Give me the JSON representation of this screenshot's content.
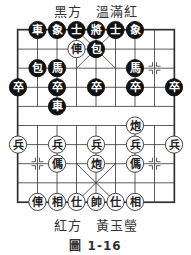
{
  "header": {
    "black_side": "黑方　溫滿紅"
  },
  "footer": {
    "red_side": "紅方　黃玉瑩",
    "figure": "圖 1-16"
  },
  "board": {
    "cols": 9,
    "rows": 10,
    "origin_x": 18,
    "origin_y": 30,
    "dx": 19.5,
    "dy": 19.1,
    "colors": {
      "line": "#333333",
      "black_piece": "#111111",
      "red_piece_fill": "#ffffff",
      "red_piece_text": "#222222"
    },
    "pieces": [
      {
        "side": "black",
        "char": "車",
        "col": 1,
        "row": 0
      },
      {
        "side": "black",
        "char": "象",
        "col": 2,
        "row": 0
      },
      {
        "side": "black",
        "char": "士",
        "col": 3,
        "row": 0
      },
      {
        "side": "black",
        "char": "將",
        "col": 4,
        "row": 0
      },
      {
        "side": "black",
        "char": "士",
        "col": 5,
        "row": 0
      },
      {
        "side": "black",
        "char": "象",
        "col": 6,
        "row": 0
      },
      {
        "side": "red",
        "char": "俥",
        "col": 3,
        "row": 1
      },
      {
        "side": "black",
        "char": "包",
        "col": 4,
        "row": 1
      },
      {
        "side": "black",
        "char": "包",
        "col": 1,
        "row": 2
      },
      {
        "side": "black",
        "char": "馬",
        "col": 2,
        "row": 2
      },
      {
        "side": "black",
        "char": "馬",
        "col": 6,
        "row": 2
      },
      {
        "side": "black",
        "char": "卒",
        "col": 0,
        "row": 3
      },
      {
        "side": "black",
        "char": "卒",
        "col": 2,
        "row": 3
      },
      {
        "side": "black",
        "char": "卒",
        "col": 4,
        "row": 3
      },
      {
        "side": "black",
        "char": "卒",
        "col": 6,
        "row": 3
      },
      {
        "side": "black",
        "char": "卒",
        "col": 8,
        "row": 3
      },
      {
        "side": "black",
        "char": "車",
        "col": 2,
        "row": 4
      },
      {
        "side": "red",
        "char": "炮",
        "col": 6,
        "row": 5
      },
      {
        "side": "red",
        "char": "兵",
        "col": 0,
        "row": 6
      },
      {
        "side": "red",
        "char": "兵",
        "col": 2,
        "row": 6
      },
      {
        "side": "red",
        "char": "兵",
        "col": 4,
        "row": 6
      },
      {
        "side": "red",
        "char": "兵",
        "col": 6,
        "row": 6
      },
      {
        "side": "red",
        "char": "兵",
        "col": 8,
        "row": 6
      },
      {
        "side": "red",
        "char": "傌",
        "col": 2,
        "row": 7
      },
      {
        "side": "red",
        "char": "炮",
        "col": 4,
        "row": 7
      },
      {
        "side": "red",
        "char": "傌",
        "col": 6,
        "row": 7
      },
      {
        "side": "red",
        "char": "俥",
        "col": 1,
        "row": 9
      },
      {
        "side": "red",
        "char": "相",
        "col": 2,
        "row": 9
      },
      {
        "side": "red",
        "char": "仕",
        "col": 3,
        "row": 9
      },
      {
        "side": "red",
        "char": "帥",
        "col": 4,
        "row": 9
      },
      {
        "side": "red",
        "char": "仕",
        "col": 5,
        "row": 9
      },
      {
        "side": "red",
        "char": "相",
        "col": 6,
        "row": 9
      }
    ],
    "position_marks": [
      {
        "col": 7,
        "row": 2
      },
      {
        "col": 1,
        "row": 7
      },
      {
        "col": 7,
        "row": 7
      }
    ]
  }
}
